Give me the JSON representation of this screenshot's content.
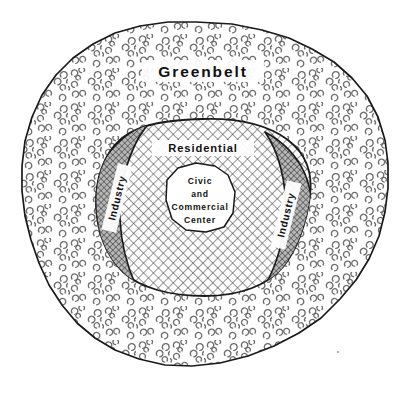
{
  "diagram": {
    "title": "Greenbelt",
    "type": "concentric-land-use-zone-diagram",
    "background_color": "#ffffff",
    "line_color": "#1a1a1a",
    "zones": [
      {
        "id": "greenbelt",
        "label": "Greenbelt",
        "ring": 1,
        "fill_pattern": "stipple-crescents",
        "fill_color": "#ffffff",
        "description": "outermost irregular blob with scattered tree stipple texture"
      },
      {
        "id": "residential",
        "label": "Residential",
        "ring": 2,
        "fill_pattern": "crosshatch-light",
        "fill_color": "#ffffff",
        "description": "inner city area with light diagonal cross-hatch"
      },
      {
        "id": "industry-left",
        "label": "Industry",
        "ring": 3,
        "fill_pattern": "crosshatch-dense",
        "fill_color": "#9a9a9a",
        "description": "left crescent band with dense dark cross-hatch",
        "rotation": -90
      },
      {
        "id": "industry-right",
        "label": "Industry",
        "ring": 3,
        "fill_pattern": "crosshatch-dense",
        "fill_color": "#9a9a9a",
        "description": "right crescent band with dense dark cross-hatch",
        "rotation": -90
      },
      {
        "id": "civic-commercial-center",
        "ring": 4,
        "fill_pattern": "solid",
        "fill_color": "#ffffff",
        "description": "central white irregular polygon",
        "label_lines": [
          "Civic",
          "and",
          "Commercial",
          "Center"
        ]
      }
    ],
    "center_label": {
      "line1": "Civic",
      "line2": "and",
      "line3": "Commercial",
      "line4": "Center"
    },
    "labels": {
      "greenbelt": "Greenbelt",
      "residential": "Residential",
      "industry_left": "Industry",
      "industry_right": "Industry"
    }
  }
}
